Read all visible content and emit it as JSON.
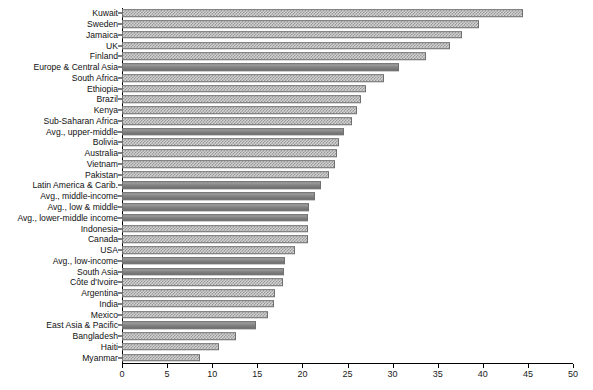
{
  "chart_data": {
    "type": "bar",
    "orientation": "horizontal",
    "title": "",
    "subtitle": "",
    "xlabel": "",
    "ylabel": "",
    "xlim": [
      0,
      50
    ],
    "ylim": null,
    "grid": false,
    "legend": null,
    "xticks": [
      0,
      5,
      10,
      15,
      20,
      25,
      30,
      35,
      40,
      45,
      50
    ],
    "xtick_labels": [
      "0",
      "5",
      "10",
      "15",
      "20",
      "25",
      "30",
      "35",
      "40",
      "45",
      "50"
    ],
    "categories": [
      "Kuwait",
      "Sweden",
      "Jamaica",
      "UK",
      "Finland",
      "Europe & Central Asia",
      "South Africa",
      "Ethiopia",
      "Brazil",
      "Kenya",
      "Sub-Saharan Africa",
      "Avg., upper-middle",
      "Bolivia",
      "Australia",
      "Vietnam",
      "Pakistan",
      "Latin America & Carib.",
      "Avg., middle-income",
      "Avg., low & middle",
      "Avg., lower-middle income",
      "Indonesia",
      "Canada",
      "USA",
      "Avg., low-income",
      "South Asia",
      "Côte d'Ivoire",
      "Argentina",
      "India",
      "Mexico",
      "East Asia & Pacific",
      "Bangladesh",
      "Haiti",
      "Myanmar"
    ],
    "values": [
      44.5,
      39.6,
      37.7,
      36.4,
      33.7,
      30.7,
      29.0,
      27.0,
      26.5,
      26.0,
      25.5,
      24.6,
      24.1,
      23.8,
      23.6,
      23.0,
      22.1,
      21.4,
      20.7,
      20.6,
      20.6,
      20.6,
      19.2,
      18.1,
      18.0,
      17.9,
      17.0,
      16.8,
      16.2,
      14.9,
      12.6,
      10.7,
      8.6
    ],
    "series_pattern": [
      "check",
      "check",
      "check",
      "check",
      "check",
      "solid",
      "check",
      "check",
      "check",
      "check",
      "check",
      "solid",
      "check",
      "check",
      "check",
      "check",
      "solid",
      "solid",
      "solid",
      "solid",
      "check",
      "check",
      "check",
      "solid",
      "solid",
      "check",
      "check",
      "check",
      "check",
      "solid",
      "check",
      "check",
      "check"
    ],
    "colors": {
      "bar_fill_check_light": "#d9d9d9",
      "bar_fill_check_dark": "#8a8a8a",
      "bar_fill_solid": "#8f8f8f",
      "bar_border": "#6f6f6f",
      "axis": "#000000",
      "text": "#111111",
      "background": "#ffffff"
    }
  }
}
